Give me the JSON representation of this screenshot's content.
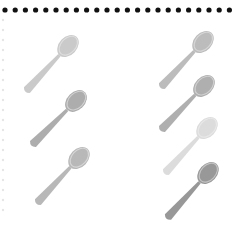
{
  "worksheet": {
    "border": {
      "style": "dotted-top",
      "dot_color": "#111111",
      "dot_count": 23,
      "dot_y": 10,
      "dot_start_x": 5,
      "dot_spacing": 10.2,
      "dot_radius": 2.6,
      "faint_left_dots": {
        "x": 3,
        "color": "#e6e6e6",
        "start_y": 20,
        "spacing": 10,
        "count": 20
      }
    },
    "groups": [
      {
        "name": "left-group",
        "count": 3,
        "spoons": [
          {
            "bowl": [
              68,
              46
            ],
            "handle_end": [
              27,
              90
            ],
            "fill": "#cacaca",
            "ring": "#dedede"
          },
          {
            "bowl": [
              76,
              101
            ],
            "handle_end": [
              33,
              144
            ],
            "fill": "#adadad",
            "ring": "#d2d2d2"
          },
          {
            "bowl": [
              79,
              158
            ],
            "handle_end": [
              38,
              202
            ],
            "fill": "#b8b8b8",
            "ring": "#d6d6d6"
          }
        ]
      },
      {
        "name": "right-group",
        "count": 4,
        "spoons": [
          {
            "bowl": [
              203,
              42
            ],
            "handle_end": [
              162,
              86
            ],
            "fill": "#bcbcbc",
            "ring": "#d6d6d6"
          },
          {
            "bowl": [
              204,
              86
            ],
            "handle_end": [
              162,
              129
            ],
            "fill": "#afafaf",
            "ring": "#d0d0d0"
          },
          {
            "bowl": [
              207,
              128
            ],
            "handle_end": [
              166,
              172
            ],
            "fill": "#dcdcdc",
            "ring": "#e8e8e8"
          },
          {
            "bowl": [
              208,
              173
            ],
            "handle_end": [
              168,
              217
            ],
            "fill": "#989898",
            "ring": "#c4c4c4"
          }
        ]
      }
    ]
  }
}
